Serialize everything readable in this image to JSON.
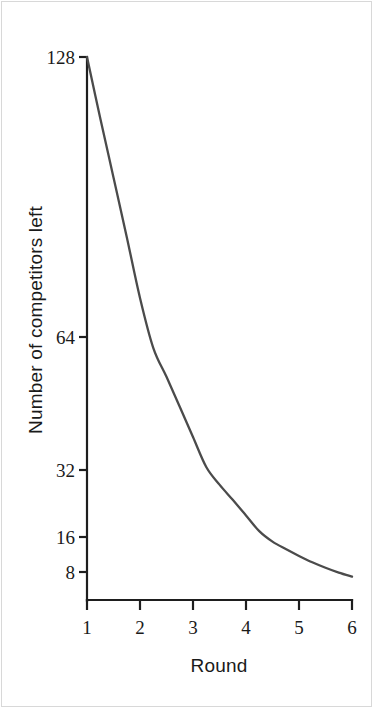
{
  "figure": {
    "background_color": "#ffffff",
    "frame_color": "#d8d8d8",
    "axis_color": "#1e1e1e",
    "curve_color": "#4b4b4b"
  },
  "chart_data": {
    "type": "line",
    "title": "",
    "subtitle": "",
    "xlabel": "Round",
    "ylabel": "Number of competitors left",
    "grid": false,
    "legend": false,
    "legend_position": "none",
    "xscale": "linear",
    "yscale": "log2",
    "xlim": [
      1,
      6
    ],
    "ylim": [
      6.4,
      128
    ],
    "xticks": [
      1,
      2,
      3,
      4,
      5,
      6
    ],
    "xtick_labels": [
      "1",
      "2",
      "3",
      "4",
      "5",
      "6"
    ],
    "yticks": [
      8,
      16,
      32,
      64,
      128
    ],
    "ytick_labels": [
      "8",
      "16",
      "32",
      "64",
      "128"
    ],
    "series": [
      {
        "name": "Competitors remaining",
        "x": [
          1,
          1.25,
          1.5,
          1.75,
          2,
          2.25,
          2.5,
          2.75,
          3,
          3.25,
          3.5,
          3.75,
          4,
          4.25,
          4.5,
          4.75,
          5,
          5.25,
          5.5,
          5.75,
          6
        ],
        "values": [
          128,
          110,
          95,
          82,
          70.5,
          60.5,
          52,
          44.5,
          38,
          32.5,
          27.5,
          23.5,
          20,
          17,
          14.6,
          12.6,
          11,
          9.7,
          8.7,
          7.9,
          7.3
        ]
      }
    ],
    "annotations": []
  },
  "axis": {
    "x_tick_labels": [
      "1",
      "2",
      "3",
      "4",
      "5",
      "6"
    ],
    "y_tick_labels": [
      "128",
      "64",
      "32",
      "16",
      "8"
    ],
    "x_title": "Round",
    "y_title": "Number of competitors left"
  }
}
